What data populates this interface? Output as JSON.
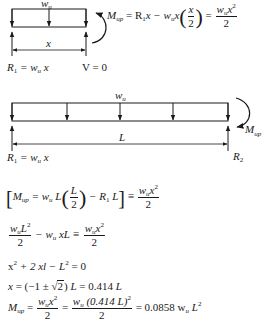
{
  "figure1": {
    "load_label": "w",
    "load_sub": "u",
    "dimension_label": "x",
    "reaction_label": "R",
    "reaction_sub": "1",
    "reaction_rhs": " = w",
    "reaction_rhs_sub": "u",
    "reaction_rhs_tail": " x",
    "shear_label": "V = 0",
    "moment_equation": {
      "lhs": "M",
      "lhs_sub": "up",
      "eq1": " = R",
      "eq1_sub": "1",
      "eq1_tail": "x − w",
      "eq1_w_sub": "u",
      "eq1_x": "x",
      "frac_num": "x",
      "frac_den": "2",
      "eq2": " = ",
      "rhs_num_w": "w",
      "rhs_num_sub": "u",
      "rhs_num_x": "x",
      "rhs_num_exp": "2",
      "rhs_den": "2"
    }
  },
  "figure2": {
    "load_label": "w",
    "load_sub": "u",
    "span_label": "L",
    "moment_label": "M",
    "moment_sub": "up",
    "left_reaction": "R",
    "left_reaction_sub": "1",
    "left_reaction_rhs": " = w",
    "left_reaction_rhs_sub": "u",
    "left_reaction_tail": " x",
    "right_reaction": "R",
    "right_reaction_sub": "2"
  },
  "equations": {
    "eq1": {
      "open": "[",
      "lhs": "M",
      "lhs_sub": "up",
      "t1": " = w",
      "t1_sub": "u",
      "t1_tail": " L",
      "frac_num": "L",
      "frac_den": "2",
      "t2": " − R",
      "t2_sub": "1",
      "t2_tail": " L",
      "close": "]",
      "eqsign": " ≡ ",
      "rhs_w": "w",
      "rhs_sub": "u",
      "rhs_x": "x",
      "rhs_exp": "2",
      "rhs_den": "2"
    },
    "eq2": {
      "num_w": "w",
      "num_sub": "u",
      "num_L": "L",
      "num_exp": "2",
      "den": "2",
      "mid": " − w",
      "mid_sub": "u",
      "mid_tail": " xL ≡ ",
      "rhs_w": "w",
      "rhs_sub": "u",
      "rhs_x": "x",
      "rhs_exp": "2",
      "rhs_den": "2"
    },
    "eq3": {
      "a": "x",
      "a_exp": "2",
      "b": " + 2 xl − ",
      "c": "L",
      "c_exp": "2",
      "d": " = 0"
    },
    "eq4": {
      "a": "x",
      "b": " = (−1 ± ",
      "sqrt_arg": "2",
      "c": ") ",
      "d": "L",
      "e": " = 0.414 ",
      "f": "L"
    },
    "eq5": {
      "lhs": "M",
      "lhs_sub": "up",
      "eq": " = ",
      "f1_w": "w",
      "f1_sub": "u",
      "f1_x": "x",
      "f1_exp": "2",
      "f1_den": "2",
      "eq2": " = ",
      "f2_w": "w",
      "f2_sub": "u",
      "f2_paren": " (0.414 L)",
      "f2_exp": "2",
      "f2_den": "2",
      "result": " = 0.0858 w",
      "result_sub": "u",
      "result_L": " L",
      "result_exp": "2"
    }
  }
}
